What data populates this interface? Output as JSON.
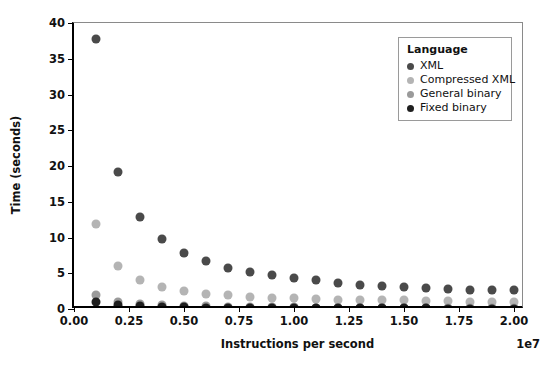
{
  "chart_data": {
    "type": "scatter",
    "title": "",
    "xlabel": "Instructions per second",
    "ylabel": "Time (seconds)",
    "x_exponent_label": "1e7",
    "xlim": [
      0.0,
      2.05
    ],
    "ylim": [
      0,
      40
    ],
    "xticks": [
      0.0,
      0.25,
      0.5,
      0.75,
      1.0,
      1.25,
      1.5,
      1.75,
      2.0
    ],
    "xtick_labels": [
      "0.00",
      "0.25",
      "0.50",
      "0.75",
      "1.00",
      "1.25",
      "1.50",
      "1.75",
      "2.00"
    ],
    "yticks": [
      0,
      5,
      10,
      15,
      20,
      25,
      30,
      35,
      40
    ],
    "ytick_labels": [
      "0",
      "5",
      "10",
      "15",
      "20",
      "25",
      "30",
      "35",
      "40"
    ],
    "grid": false,
    "legend_position": "upper right",
    "legend_title": "Language",
    "x": [
      0.1,
      0.2,
      0.3,
      0.4,
      0.5,
      0.6,
      0.7,
      0.8,
      0.9,
      1.0,
      1.1,
      1.2,
      1.3,
      1.4,
      1.5,
      1.6,
      1.7,
      1.8,
      1.9,
      2.0
    ],
    "series": [
      {
        "name": "XML",
        "color": "#4a4a4a",
        "values": [
          37.8,
          19.2,
          12.9,
          9.8,
          7.9,
          6.7,
          5.8,
          5.2,
          4.7,
          4.3,
          4.0,
          3.7,
          3.4,
          3.2,
          3.1,
          2.9,
          2.8,
          2.7,
          2.6,
          2.6
        ]
      },
      {
        "name": "Compressed XML",
        "color": "#b4b4b4",
        "values": [
          11.9,
          6.0,
          4.1,
          3.1,
          2.5,
          2.1,
          1.9,
          1.7,
          1.6,
          1.5,
          1.4,
          1.3,
          1.3,
          1.2,
          1.2,
          1.1,
          1.1,
          1.0,
          1.0,
          1.0
        ]
      },
      {
        "name": "General binary",
        "color": "#9a9a9a",
        "values": [
          2.0,
          1.0,
          0.7,
          0.5,
          0.4,
          0.35,
          0.3,
          0.27,
          0.25,
          0.22,
          0.2,
          0.19,
          0.18,
          0.17,
          0.16,
          0.15,
          0.14,
          0.13,
          0.12,
          0.12
        ]
      },
      {
        "name": "Fixed binary",
        "color": "#1f1f1f",
        "values": [
          1.0,
          0.5,
          0.35,
          0.27,
          0.22,
          0.18,
          0.16,
          0.14,
          0.12,
          0.11,
          0.1,
          0.09,
          0.085,
          0.08,
          0.075,
          0.07,
          0.065,
          0.06,
          0.055,
          0.05
        ]
      }
    ]
  },
  "legend": {
    "title": "Language",
    "items": [
      {
        "label": "XML",
        "color": "#4a4a4a"
      },
      {
        "label": "Compressed XML",
        "color": "#b4b4b4"
      },
      {
        "label": "General binary",
        "color": "#9a9a9a"
      },
      {
        "label": "Fixed binary",
        "color": "#1f1f1f"
      }
    ]
  },
  "style": {
    "background": "#ffffff",
    "axis_color": "#000000",
    "frame_color": "#8a8a8a",
    "marker_radius_px": 4.5
  }
}
